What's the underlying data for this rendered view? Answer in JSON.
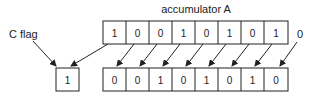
{
  "title": "accumulator A",
  "carry_label": "C flag",
  "shift_in": "0",
  "carry_value": "1",
  "accumulator_before": [
    "1",
    "0",
    "0",
    "1",
    "0",
    "1",
    "0",
    "1"
  ],
  "accumulator_after": [
    "0",
    "0",
    "1",
    "0",
    "1",
    "0",
    "1",
    "0"
  ]
}
